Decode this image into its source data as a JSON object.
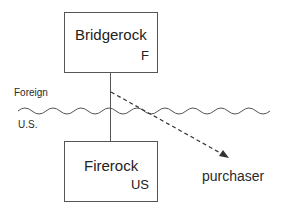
{
  "diagram": {
    "entities": [
      {
        "name": "Bridgerock",
        "tag": "F"
      },
      {
        "name": "Firerock",
        "tag": "US"
      }
    ],
    "border_labels": {
      "above": "Foreign",
      "below": "U.S."
    },
    "endpoint": {
      "label": "purchaser"
    },
    "edges": [
      {
        "from": "Bridgerock",
        "to": "Firerock",
        "style": "solid"
      },
      {
        "from": "Bridgerock",
        "to": "purchaser",
        "style": "dashed-arrow"
      }
    ]
  }
}
